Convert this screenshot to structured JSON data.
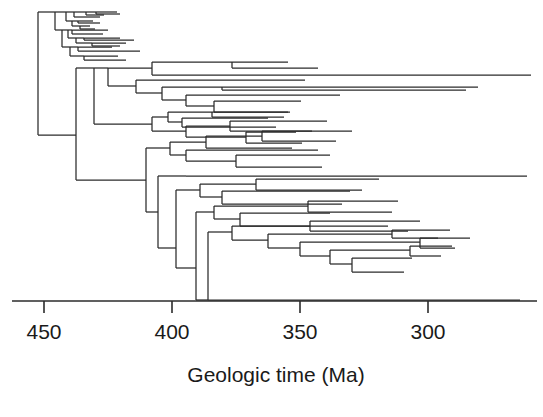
{
  "figure": {
    "type": "phylogenetic-tree"
  },
  "axis": {
    "title": "Geologic time (Ma)",
    "ticks": [
      {
        "value": 450,
        "label": "450",
        "x": 44
      },
      {
        "value": 400,
        "label": "400",
        "x": 172
      },
      {
        "value": 350,
        "label": "350",
        "x": 300
      },
      {
        "value": 300,
        "label": "300",
        "x": 428
      }
    ],
    "line": {
      "x1": 12,
      "x2": 537,
      "y": 301
    },
    "tick_length": 12,
    "direction": "reversed",
    "units": "Ma",
    "px_per_ma": 2.56,
    "domain_ma": [
      455.4,
      283.2
    ]
  },
  "chart_data": {
    "type": "tree",
    "title": "",
    "xlabel": "Geologic time (Ma)",
    "ylabel": "",
    "xlim": [
      458,
      280
    ],
    "grid": false,
    "legend": null,
    "root": {
      "x_ma": 456,
      "y": 12,
      "y2": 135
    },
    "n_tips": 60,
    "colors": {
      "branch": "#2b2b2b",
      "axis": "#2b2b2b",
      "background": "#ffffff"
    },
    "branches_px": [
      [
        38,
        12,
        38,
        135
      ],
      [
        38,
        12,
        55,
        12
      ],
      [
        55,
        12,
        55,
        30
      ],
      [
        55,
        12,
        66,
        12
      ],
      [
        66,
        12,
        66,
        21
      ],
      [
        66,
        12,
        74,
        12
      ],
      [
        74,
        12,
        74,
        17
      ],
      [
        74,
        12,
        86,
        12
      ],
      [
        86,
        12,
        86,
        15
      ],
      [
        86,
        12,
        96,
        12
      ],
      [
        96,
        12,
        96,
        14
      ],
      [
        96,
        12,
        117,
        12
      ],
      [
        96,
        14,
        120,
        14
      ],
      [
        86,
        15,
        104,
        15
      ],
      [
        74,
        17,
        100,
        17
      ],
      [
        66,
        21,
        72,
        21
      ],
      [
        72,
        21,
        72,
        26
      ],
      [
        72,
        21,
        78,
        21
      ],
      [
        78,
        21,
        78,
        23
      ],
      [
        78,
        21,
        93,
        21
      ],
      [
        78,
        23,
        100,
        23
      ],
      [
        72,
        26,
        80,
        26
      ],
      [
        80,
        26,
        80,
        29
      ],
      [
        80,
        26,
        90,
        26
      ],
      [
        80,
        29,
        95,
        29
      ],
      [
        55,
        30,
        62,
        30
      ],
      [
        62,
        30,
        62,
        47
      ],
      [
        62,
        30,
        68,
        30
      ],
      [
        68,
        30,
        68,
        38
      ],
      [
        68,
        30,
        72,
        30
      ],
      [
        72,
        30,
        72,
        34
      ],
      [
        72,
        30,
        108,
        30
      ],
      [
        72,
        34,
        103,
        34
      ],
      [
        68,
        38,
        76,
        38
      ],
      [
        76,
        38,
        76,
        43
      ],
      [
        76,
        38,
        84,
        38
      ],
      [
        84,
        38,
        84,
        40
      ],
      [
        84,
        38,
        120,
        38
      ],
      [
        84,
        40,
        134,
        40
      ],
      [
        76,
        43,
        92,
        43
      ],
      [
        92,
        43,
        92,
        46
      ],
      [
        92,
        43,
        126,
        43
      ],
      [
        92,
        46,
        120,
        46
      ],
      [
        62,
        47,
        70,
        47
      ],
      [
        70,
        47,
        70,
        56
      ],
      [
        70,
        47,
        78,
        47
      ],
      [
        78,
        47,
        78,
        51
      ],
      [
        78,
        47,
        112,
        47
      ],
      [
        78,
        51,
        140,
        51
      ],
      [
        70,
        56,
        84,
        56
      ],
      [
        84,
        56,
        84,
        60
      ],
      [
        84,
        56,
        118,
        56
      ],
      [
        84,
        60,
        126,
        60
      ],
      [
        38,
        135,
        76,
        135
      ],
      [
        76,
        68,
        76,
        180
      ],
      [
        76,
        68,
        94,
        68
      ],
      [
        94,
        68,
        94,
        97
      ],
      [
        94,
        68,
        108,
        68
      ],
      [
        108,
        68,
        108,
        86
      ],
      [
        108,
        68,
        152,
        68
      ],
      [
        152,
        62,
        152,
        75
      ],
      [
        152,
        62,
        232,
        62
      ],
      [
        232,
        62,
        232,
        68
      ],
      [
        232,
        62,
        288,
        62
      ],
      [
        232,
        68,
        318,
        68
      ],
      [
        152,
        75,
        531,
        75
      ],
      [
        108,
        86,
        136,
        86
      ],
      [
        136,
        80,
        136,
        93
      ],
      [
        136,
        80,
        305,
        80
      ],
      [
        136,
        93,
        162,
        93
      ],
      [
        162,
        87,
        162,
        100
      ],
      [
        162,
        87,
        222,
        87
      ],
      [
        222,
        87,
        222,
        90
      ],
      [
        222,
        87,
        478,
        87
      ],
      [
        222,
        90,
        466,
        90
      ],
      [
        162,
        100,
        186,
        100
      ],
      [
        186,
        95,
        186,
        106
      ],
      [
        186,
        95,
        340,
        95
      ],
      [
        186,
        106,
        214,
        106
      ],
      [
        214,
        101,
        214,
        112
      ],
      [
        214,
        101,
        301,
        101
      ],
      [
        214,
        112,
        288,
        112
      ],
      [
        94,
        97,
        94,
        124
      ],
      [
        94,
        124,
        152,
        124
      ],
      [
        152,
        117,
        152,
        131
      ],
      [
        152,
        117,
        168,
        117
      ],
      [
        168,
        112,
        168,
        122
      ],
      [
        168,
        112,
        212,
        112
      ],
      [
        212,
        112,
        212,
        117
      ],
      [
        212,
        112,
        290,
        112
      ],
      [
        212,
        117,
        284,
        117
      ],
      [
        168,
        122,
        182,
        122
      ],
      [
        182,
        118,
        182,
        127
      ],
      [
        182,
        118,
        268,
        118
      ],
      [
        182,
        127,
        276,
        127
      ],
      [
        152,
        131,
        186,
        131
      ],
      [
        186,
        126,
        186,
        137
      ],
      [
        186,
        126,
        230,
        126
      ],
      [
        230,
        121,
        230,
        131
      ],
      [
        230,
        121,
        327,
        121
      ],
      [
        230,
        131,
        312,
        131
      ],
      [
        186,
        137,
        246,
        137
      ],
      [
        246,
        132,
        246,
        143
      ],
      [
        246,
        132,
        296,
        132
      ],
      [
        246,
        143,
        302,
        143
      ],
      [
        76,
        180,
        146,
        180
      ],
      [
        146,
        148,
        146,
        212
      ],
      [
        146,
        148,
        170,
        148
      ],
      [
        170,
        142,
        170,
        155
      ],
      [
        170,
        142,
        206,
        142
      ],
      [
        206,
        136,
        206,
        148
      ],
      [
        206,
        136,
        262,
        136
      ],
      [
        262,
        131,
        262,
        141
      ],
      [
        262,
        131,
        352,
        131
      ],
      [
        262,
        141,
        336,
        141
      ],
      [
        206,
        148,
        292,
        148
      ],
      [
        170,
        155,
        186,
        155
      ],
      [
        186,
        150,
        186,
        161
      ],
      [
        186,
        150,
        318,
        150
      ],
      [
        186,
        161,
        236,
        161
      ],
      [
        236,
        155,
        236,
        167
      ],
      [
        236,
        155,
        330,
        155
      ],
      [
        236,
        167,
        322,
        167
      ],
      [
        146,
        212,
        158,
        212
      ],
      [
        158,
        176,
        158,
        248
      ],
      [
        158,
        176,
        186,
        176
      ],
      [
        186,
        176,
        527,
        176
      ],
      [
        158,
        248,
        176,
        248
      ],
      [
        176,
        190,
        176,
        268
      ],
      [
        176,
        190,
        200,
        190
      ],
      [
        200,
        184,
        200,
        197
      ],
      [
        200,
        184,
        256,
        184
      ],
      [
        256,
        179,
        256,
        190
      ],
      [
        256,
        179,
        379,
        179
      ],
      [
        256,
        190,
        362,
        190
      ],
      [
        200,
        197,
        222,
        197
      ],
      [
        222,
        191,
        222,
        204
      ],
      [
        222,
        191,
        350,
        191
      ],
      [
        222,
        204,
        342,
        204
      ],
      [
        176,
        268,
        196,
        268
      ],
      [
        196,
        212,
        196,
        300
      ],
      [
        196,
        212,
        214,
        212
      ],
      [
        214,
        206,
        214,
        219
      ],
      [
        214,
        206,
        308,
        206
      ],
      [
        308,
        201,
        308,
        212
      ],
      [
        308,
        201,
        398,
        201
      ],
      [
        308,
        212,
        392,
        212
      ],
      [
        214,
        219,
        240,
        219
      ],
      [
        240,
        213,
        240,
        226
      ],
      [
        240,
        213,
        330,
        213
      ],
      [
        240,
        226,
        388,
        226
      ],
      [
        196,
        300,
        208,
        300
      ],
      [
        208,
        232,
        208,
        300
      ],
      [
        208,
        232,
        232,
        232
      ],
      [
        232,
        226,
        232,
        240
      ],
      [
        232,
        226,
        310,
        226
      ],
      [
        310,
        221,
        310,
        231
      ],
      [
        310,
        221,
        420,
        221
      ],
      [
        310,
        231,
        408,
        231
      ],
      [
        232,
        240,
        268,
        240
      ],
      [
        268,
        234,
        268,
        248
      ],
      [
        268,
        234,
        392,
        234
      ],
      [
        392,
        230,
        392,
        238
      ],
      [
        392,
        230,
        450,
        230
      ],
      [
        392,
        238,
        438,
        238
      ],
      [
        268,
        248,
        300,
        248
      ],
      [
        300,
        242,
        300,
        256
      ],
      [
        300,
        242,
        420,
        242
      ],
      [
        420,
        238,
        420,
        248
      ],
      [
        420,
        238,
        470,
        238
      ],
      [
        420,
        248,
        455,
        248
      ],
      [
        300,
        256,
        330,
        256
      ],
      [
        330,
        250,
        330,
        264
      ],
      [
        330,
        250,
        410,
        250
      ],
      [
        410,
        246,
        410,
        256
      ],
      [
        410,
        246,
        452,
        246
      ],
      [
        410,
        256,
        441,
        256
      ],
      [
        330,
        264,
        352,
        264
      ],
      [
        352,
        258,
        352,
        272
      ],
      [
        352,
        258,
        412,
        258
      ],
      [
        352,
        272,
        404,
        272
      ],
      [
        208,
        300,
        520,
        300
      ]
    ]
  }
}
